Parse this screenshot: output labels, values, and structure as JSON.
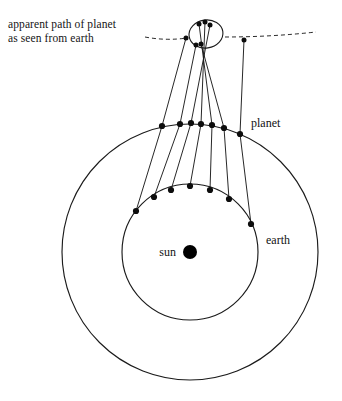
{
  "figure": {
    "caption": "apparent path of planet\nas seen from earth",
    "labels": {
      "planet": "planet",
      "earth": "earth",
      "sun": "sun"
    },
    "colors": {
      "ink": "#1b1b1b",
      "marker": "#0d0d0d",
      "background": "#ffffff",
      "dashed": "#2a2a2a"
    }
  },
  "chart_data": {
    "type": "diagram",
    "center": {
      "x": 190,
      "y": 252
    },
    "orbits": [
      {
        "name": "earth-orbit",
        "radius": 68,
        "bodies": "earth"
      },
      {
        "name": "planet-orbit",
        "radius": 128,
        "bodies": "planet"
      }
    ],
    "sun": {
      "x": 190,
      "y": 252,
      "radius": 7
    },
    "earth_positions": [
      {
        "i": 1,
        "x": 136,
        "y": 211
      },
      {
        "i": 2,
        "x": 154,
        "y": 197
      },
      {
        "i": 3,
        "x": 171,
        "y": 190
      },
      {
        "i": 4,
        "x": 190,
        "y": 186
      },
      {
        "i": 5,
        "x": 210,
        "y": 190
      },
      {
        "i": 6,
        "x": 229,
        "y": 199
      },
      {
        "i": 7,
        "x": 251,
        "y": 224
      }
    ],
    "planet_positions": [
      {
        "i": 1,
        "x": 162,
        "y": 126
      },
      {
        "i": 2,
        "x": 180,
        "y": 124
      },
      {
        "i": 3,
        "x": 191,
        "y": 123
      },
      {
        "i": 4,
        "x": 201,
        "y": 124
      },
      {
        "i": 5,
        "x": 212,
        "y": 125
      },
      {
        "i": 6,
        "x": 224,
        "y": 128
      },
      {
        "i": 7,
        "x": 240,
        "y": 134
      }
    ],
    "apparent_positions": [
      {
        "i": 1,
        "x": 186,
        "y": 38
      },
      {
        "i": 2,
        "x": 196,
        "y": 45
      },
      {
        "i": 3,
        "x": 210,
        "y": 25
      },
      {
        "i": 4,
        "x": 205,
        "y": 22
      },
      {
        "i": 5,
        "x": 199,
        "y": 24
      },
      {
        "i": 6,
        "x": 201,
        "y": 44
      },
      {
        "i": 7,
        "x": 244,
        "y": 40
      }
    ],
    "apparent_path": {
      "shape": "shallow arc with a retrograde loop",
      "start": {
        "x": 145,
        "y": 37
      },
      "end": {
        "x": 316,
        "y": 32
      },
      "loop_center": {
        "x": 206,
        "y": 34
      },
      "loop_rx": 17,
      "loop_ry": 14,
      "style": "dashed"
    },
    "sightline_count": 7,
    "marker_radius": 3.1
  }
}
